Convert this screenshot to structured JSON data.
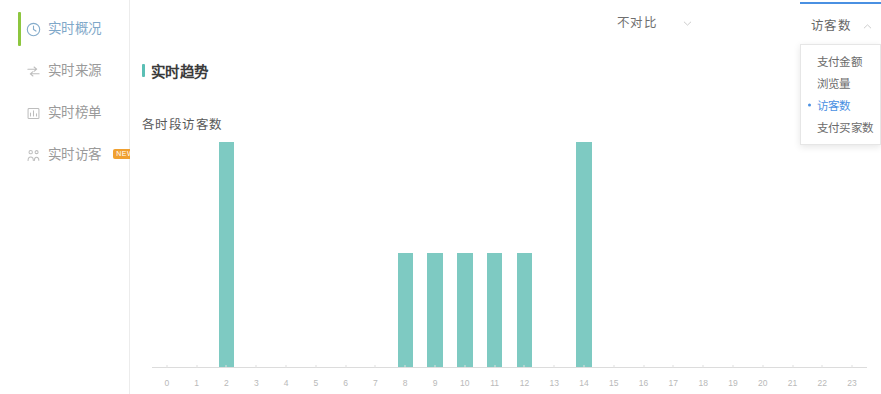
{
  "sidebar": {
    "items": [
      {
        "label": "实时概况",
        "icon": "clock-icon",
        "active": true,
        "badge": ""
      },
      {
        "label": "实时来源",
        "icon": "flow-arrows-icon",
        "active": false,
        "badge": ""
      },
      {
        "label": "实时榜单",
        "icon": "ranking-list-icon",
        "active": false,
        "badge": ""
      },
      {
        "label": "实时访客",
        "icon": "visitors-icon",
        "active": false,
        "badge": "NEW"
      }
    ]
  },
  "header": {
    "title": "实时趋势",
    "compare": {
      "label": "不对比",
      "icon": "chevron-down-icon"
    },
    "metric": {
      "label": "访客数",
      "icon": "chevron-up-icon",
      "accent_color": "#4a90e2",
      "options": [
        {
          "label": "支付金额",
          "selected": false
        },
        {
          "label": "浏览量",
          "selected": false
        },
        {
          "label": "访客数",
          "selected": true
        },
        {
          "label": "支付买家数",
          "selected": false
        }
      ]
    }
  },
  "chart_data": {
    "type": "bar",
    "title": "各时段访客数",
    "xlabel": "",
    "ylabel": "",
    "grid": false,
    "legend": null,
    "bar_color": "#7ecac2",
    "ylim": [
      0,
      100
    ],
    "categories": [
      "0",
      "1",
      "2",
      "3",
      "4",
      "5",
      "6",
      "7",
      "8",
      "9",
      "10",
      "11",
      "12",
      "13",
      "14",
      "15",
      "16",
      "17",
      "18",
      "19",
      "20",
      "21",
      "22",
      "23"
    ],
    "values": [
      0,
      0,
      100,
      0,
      0,
      0,
      0,
      0,
      51,
      51,
      51,
      51,
      51,
      0,
      100,
      0,
      0,
      0,
      0,
      0,
      0,
      0,
      0,
      0
    ]
  }
}
